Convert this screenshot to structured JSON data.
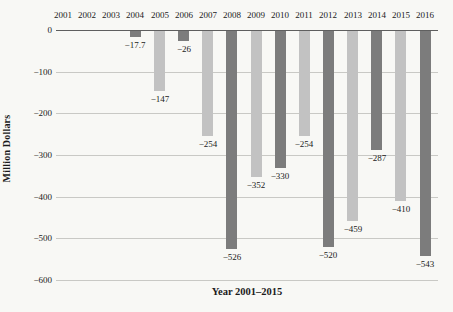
{
  "chart_data": {
    "type": "bar",
    "title": "",
    "xlabel": "Year 2001–2015",
    "ylabel": "Million Dollars",
    "ylim": [
      -600,
      0
    ],
    "grid": "horizontal",
    "legend": "none",
    "ytick_values": [
      0,
      -100,
      -200,
      -300,
      -400,
      -500,
      -600
    ],
    "ytick_labels": [
      "0",
      "−100",
      "−200",
      "−300",
      "−400",
      "−500",
      "−600"
    ],
    "categories": [
      "2001",
      "2002",
      "2003",
      "2004",
      "2005",
      "2006",
      "2007",
      "2008",
      "2009",
      "2010",
      "2011",
      "2012",
      "2013",
      "2014",
      "2015",
      "2016"
    ],
    "values": [
      null,
      null,
      null,
      -17.7,
      -147,
      -26,
      -254,
      -526,
      -352,
      -330,
      -254,
      -520,
      -459,
      -287,
      -410,
      -543
    ],
    "value_labels": [
      "",
      "",
      "",
      "−17.7",
      "−147",
      "−26",
      "−254",
      "−526",
      "−352",
      "−330",
      "−254",
      "−520",
      "−459",
      "−287",
      "−410",
      "−543"
    ],
    "bar_shades": [
      "",
      "",
      "",
      "dark",
      "light",
      "dark",
      "light",
      "dark",
      "light",
      "dark",
      "light",
      "dark",
      "light",
      "dark",
      "light",
      "dark"
    ],
    "colors": {
      "dark_bar": "#7c7c7c",
      "light_bar": "#c2c2c2",
      "gridline": "#c9c9c5",
      "zero_line": "#5f5f5f",
      "text": "#1b1b1b",
      "background": "#f8f8f5"
    }
  }
}
